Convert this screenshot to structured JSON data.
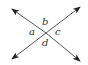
{
  "diagram": {
    "type": "intersecting-lines",
    "line_color": "#555555",
    "arrow_color": "#222222",
    "intersection": {
      "x": 46,
      "y": 33
    },
    "lines": [
      {
        "name": "line-1",
        "from": {
          "x": 12,
          "y": 9
        },
        "to": {
          "x": 80,
          "y": 61
        }
      },
      {
        "name": "line-2",
        "from": {
          "x": 12,
          "y": 59
        },
        "to": {
          "x": 80,
          "y": 7
        }
      }
    ],
    "labels": {
      "a": "a",
      "b": "b",
      "c": "c",
      "d": "d"
    }
  }
}
